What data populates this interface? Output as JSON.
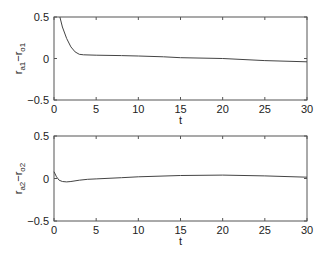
{
  "chart_data": [
    {
      "type": "line",
      "title": "",
      "xlabel": "t",
      "ylabel": "r_a1 − r_o1",
      "xlim": [
        0,
        30
      ],
      "ylim": [
        -0.5,
        0.5
      ],
      "xticks": [
        "0",
        "5",
        "10",
        "15",
        "20",
        "25",
        "30"
      ],
      "yticks": [
        "0.5",
        "0",
        "−0.5"
      ],
      "grid": false,
      "series": [
        {
          "name": "r_a1 - r_o1",
          "x": [
            0.7,
            1.0,
            1.5,
            2.0,
            2.5,
            3.0,
            3.5,
            5,
            8,
            10,
            13,
            15,
            20,
            25,
            30
          ],
          "y": [
            0.5,
            0.38,
            0.24,
            0.14,
            0.08,
            0.05,
            0.045,
            0.04,
            0.035,
            0.03,
            0.02,
            0.01,
            0.0,
            -0.025,
            -0.04
          ]
        }
      ]
    },
    {
      "type": "line",
      "title": "",
      "xlabel": "t",
      "ylabel": "r_a2 − r_o2",
      "xlim": [
        0,
        30
      ],
      "ylim": [
        -0.5,
        0.5
      ],
      "xticks": [
        "0",
        "5",
        "10",
        "15",
        "20",
        "25",
        "30"
      ],
      "yticks": [
        "0.5",
        "0",
        "−0.5"
      ],
      "grid": false,
      "series": [
        {
          "name": "r_a2 - r_o2",
          "x": [
            0,
            0.3,
            0.6,
            1.0,
            1.5,
            2.0,
            3.0,
            4.0,
            5,
            8,
            10,
            15,
            20,
            25,
            30
          ],
          "y": [
            0.08,
            0.02,
            -0.02,
            -0.035,
            -0.04,
            -0.035,
            -0.02,
            -0.01,
            -0.005,
            0.01,
            0.02,
            0.035,
            0.04,
            0.03,
            0.015
          ]
        }
      ]
    }
  ],
  "plots": [
    {
      "ylabel_main": "r",
      "ylabel_sub1": "a1",
      "ylabel_dash": "−r",
      "ylabel_sub2": "o1",
      "xlabel": "t"
    },
    {
      "ylabel_main": "r",
      "ylabel_sub1": "a2",
      "ylabel_dash": "−r",
      "ylabel_sub2": "o2",
      "xlabel": "t"
    }
  ]
}
